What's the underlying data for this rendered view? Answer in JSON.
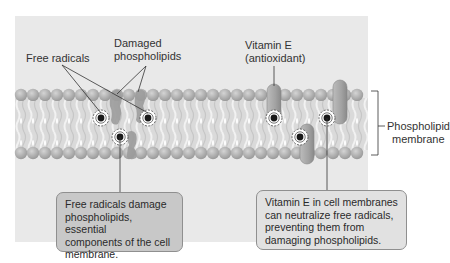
{
  "labels": {
    "free_radicals": "Free radicals",
    "damaged_line1": "Damaged",
    "damaged_line2": "phospholipids",
    "vitamin_line1": "Vitamin E",
    "vitamin_line2": "(antioxidant)",
    "membrane_line1": "Phospholipid",
    "membrane_line2": "membrane"
  },
  "callouts": {
    "left": {
      "lines": [
        "Free radicals damage",
        "phospholipids, essential",
        "components of the cell",
        "membrane."
      ]
    },
    "right": {
      "lines": [
        "Vitamin E in cell membranes",
        "can neutralize free radicals,",
        "preventing them from",
        "damaging phospholipids."
      ]
    }
  },
  "colors": {
    "panel_bg": "#e9e9e9",
    "head": "#a9a9a9",
    "tails": "#d8d8d8",
    "vitamin_e": "#a4a4a4",
    "radical_core": "#1a1a1a",
    "left_callout": "#c8c8c8",
    "right_callout": "#e1e1e1"
  }
}
